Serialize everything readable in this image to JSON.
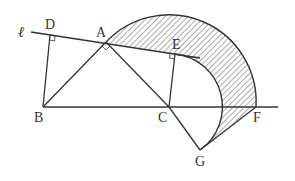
{
  "diagram": {
    "line_label": "ℓ",
    "points": {
      "A": {
        "label": "A"
      },
      "B": {
        "label": "B"
      },
      "C": {
        "label": "C"
      },
      "D": {
        "label": "D"
      },
      "E": {
        "label": "E"
      },
      "F": {
        "label": "F"
      },
      "G": {
        "label": "G"
      }
    },
    "stroke_color": "#333333",
    "hatch_color": "#444444"
  }
}
